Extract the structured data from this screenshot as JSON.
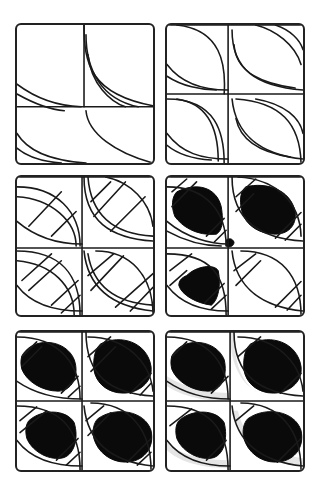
{
  "canvas": {
    "width": 323,
    "height": 489,
    "background": "#ffffff",
    "ink": "#1a1a1a"
  },
  "tiles": [
    {
      "name": "step-1",
      "x": 15,
      "y": 23,
      "paths": [
        "M0,60 C20,75 40,82 65,83",
        "M0,70 C18,80 35,86 48,87",
        "M68,0 C68,40 75,70 138,82",
        "M70,10 C70,45 85,75 123,83",
        "M72,30 C75,60 95,78 110,83",
        "M0,83 L138,83",
        "M70,87 C72,110 100,130 138,140",
        "M0,110 C12,130 40,138 70,140",
        "M0,125 C12,135 30,139 45,140",
        "M68,0 L68,83"
      ],
      "fills": [],
      "shades": []
    },
    {
      "name": "step-2",
      "x": 165,
      "y": 23,
      "paths": [
        "M0,0 L138,0",
        "M62,0 L62,140",
        "M0,70 L138,70",
        "M10,0 C55,5 60,40 58,70",
        "M0,40 C15,60 40,66 62,66",
        "M0,52 C15,62 35,66 50,66",
        "M66,5 C66,45 90,62 138,66",
        "M68,20 C70,50 100,60 130,64",
        "M90,0 C110,5 130,20 136,40",
        "M110,0 C125,5 135,15 138,25",
        "M0,75 C50,75 58,110 58,140",
        "M10,75 C45,80 52,110 52,138",
        "M0,110 C15,130 35,136 62,136",
        "M0,122 C12,132 30,136 45,137",
        "M66,75 C70,115 100,132 138,136",
        "M70,95 C75,120 100,130 125,134",
        "M70,75 C115,78 135,100 136,140",
        "M90,75 C120,80 135,95 138,110"
      ],
      "fills": [],
      "shades": []
    },
    {
      "name": "step-3",
      "x": 15,
      "y": 175,
      "paths": [
        "M0,0 L138,0",
        "M66,0 L66,140",
        "M0,72 L138,72",
        "M0,10 C40,10 64,35 64,70",
        "M0,20 C35,22 60,45 60,70",
        "M0,45 C20,62 45,68 66,68",
        "M68,0 C68,45 95,62 138,65",
        "M72,0 C75,40 100,58 138,60",
        "M90,0 C115,5 135,25 138,50",
        "M0,75 C45,75 64,100 64,140",
        "M0,85 C35,88 58,110 58,140",
        "M0,110 C15,130 40,136 66,136",
        "M68,75 C72,115 100,132 138,136",
        "M72,78 C78,115 105,128 138,130",
        "M80,75 C115,75 138,100 138,140",
        "M12,50 L45,15",
        "M35,60 L60,35",
        "M75,25 L95,5",
        "M78,40 L110,5",
        "M95,55 L130,20",
        "M5,105 L35,78",
        "M12,115 L45,85",
        "M35,130 L62,105",
        "M45,138 L64,120",
        "M72,100 L98,78",
        "M75,115 L108,80",
        "M100,132 L138,98",
        "M115,136 L138,112"
      ],
      "fills": [],
      "shades": []
    },
    {
      "name": "step-4",
      "x": 165,
      "y": 175,
      "paths": [
        "M0,0 L138,0",
        "M62,0 L62,140",
        "M0,72 L138,72",
        "M0,10 C40,10 60,35 60,70",
        "M0,45 C20,62 45,68 62,68",
        "M0,55 C20,66 40,70 55,70",
        "M66,0 C66,45 95,62 138,65",
        "M72,0 C110,2 135,25 136,60",
        "M0,78 C45,78 60,100 60,140",
        "M0,110 C15,130 40,136 62,136",
        "M66,75 C70,115 100,132 138,136",
        "M75,75 C115,75 136,100 136,140",
        "M5,15 L20,2",
        "M5,30 L30,5",
        "M40,60 L58,42",
        "M48,66 L60,54",
        "M70,20 L90,2",
        "M70,35 L88,17",
        "M110,62 L136,36",
        "M120,64 L136,48",
        "M3,95 L25,78",
        "M3,110 L20,95",
        "M38,128 L58,108",
        "M45,134 L60,120",
        "M68,95 L90,78",
        "M70,110 L95,85",
        "M110,132 L136,106",
        "M122,135 L136,120"
      ],
      "fills": [
        "M10,15 C30,5 50,10 55,30 C58,48 55,55 50,58 C30,60 15,50 8,40 C4,30 5,20 10,15 Z",
        "M80,10 C100,5 125,12 130,35 C132,50 122,58 110,58 C95,58 80,50 76,35 C73,22 75,14 80,10 Z",
        "M20,100 C30,90 48,88 52,95 C55,110 52,125 45,130 C30,128 15,120 12,110 C12,105 15,102 20,100 Z",
        "M60,64 C63,62 66,62 68,66 C68,70 64,72 60,70 Z"
      ],
      "shades": []
    },
    {
      "name": "step-5",
      "x": 15,
      "y": 330,
      "paths": [
        "M0,0 L138,0",
        "M66,0 L66,140",
        "M0,70 L138,70",
        "M0,5 C45,5 64,35 64,68",
        "M0,50 C20,64 45,68 66,68",
        "M70,0 C70,45 95,62 138,65",
        "M72,5 C110,5 135,30 138,60",
        "M0,75 C45,75 64,100 64,140",
        "M0,110 C15,130 40,136 66,136",
        "M68,75 C72,115 100,132 138,136",
        "M75,72 C115,72 136,100 136,140",
        "M5,25 L20,10",
        "M5,35 L25,15",
        "M45,62 L62,45",
        "M52,66 L64,55",
        "M72,25 L95,5",
        "M75,40 L100,15",
        "M115,62 L136,42",
        "M125,64 L136,52",
        "M3,90 L20,76",
        "M3,102 L30,80",
        "M40,130 L62,108",
        "M50,135 L64,122",
        "M70,90 L88,75",
        "M72,105 L95,82",
        "M112,132 L136,108",
        "M122,135 L136,122"
      ],
      "fills": [
        "M8,20 C20,5 50,8 58,28 C64,45 55,60 42,60 C25,60 10,50 5,38 C3,30 4,24 8,20 Z",
        "M85,12 C105,2 132,10 136,35 C138,52 122,62 108,62 C92,62 80,52 78,38 C77,25 80,16 85,12 Z",
        "M12,90 C25,78 50,78 58,92 C63,108 58,126 45,128 C30,130 15,120 10,108 C8,100 9,94 12,90 Z",
        "M82,88 C100,75 130,80 136,100 C140,118 128,132 110,132 C95,132 82,122 78,108 C76,100 78,92 82,88 Z"
      ],
      "shades": []
    },
    {
      "name": "step-6",
      "x": 165,
      "y": 330,
      "paths": [
        "M0,0 L138,0",
        "M64,0 L64,140",
        "M0,70 L138,70",
        "M0,5 C45,5 62,35 62,68",
        "M0,50 C20,64 45,68 64,68",
        "M68,0 C68,45 95,62 138,65",
        "M72,5 C110,5 135,30 138,60",
        "M0,75 C45,75 62,100 62,140",
        "M0,110 C15,130 40,136 64,136",
        "M66,75 C70,115 100,132 138,136",
        "M75,72 C115,72 136,100 136,140",
        "M5,25 L20,10",
        "M45,62 L62,45",
        "M72,25 L95,5",
        "M115,62 L136,42",
        "M3,95 L25,78",
        "M40,130 L60,110",
        "M70,90 L88,75",
        "M112,132 L136,108"
      ],
      "fills": [
        "M8,20 C20,5 50,8 58,28 C62,45 55,60 42,60 C25,60 10,50 5,38 C3,30 4,24 8,20 Z",
        "M85,12 C105,2 132,10 136,35 C138,52 122,62 108,62 C92,62 80,52 78,38 C77,25 80,16 85,12 Z",
        "M12,90 C25,78 50,78 58,92 C62,108 58,126 45,128 C30,130 15,120 10,108 C8,100 9,94 12,90 Z",
        "M82,88 C100,75 130,80 136,100 C140,118 128,132 110,132 C95,132 82,122 78,108 C76,100 78,92 82,88 Z"
      ],
      "shades": [
        "M0,55 C20,68 45,70 64,70 L64,62 C45,62 20,58 0,45 Z",
        "M64,0 C64,40 80,58 100,64 L90,60 C75,50 68,30 68,0 Z",
        "M0,120 C15,134 40,138 64,138 L64,130 C40,130 15,126 0,112 Z",
        "M66,80 C70,115 100,132 138,136 L138,128 C105,125 78,110 72,80 Z"
      ]
    }
  ]
}
